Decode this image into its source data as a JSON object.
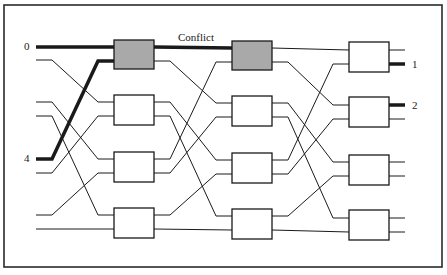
{
  "diagram": {
    "title_label": "Conflict",
    "frame": {
      "x": 4,
      "y": 5,
      "w": 438,
      "h": 262
    },
    "colors": {
      "line": "#1a1a1a",
      "box_fill": "#ffffff",
      "box_conflict_fill": "#a9a9a9",
      "frame": "#2a2a2a"
    },
    "input_x": 36,
    "output_x_end": 405,
    "columns": [
      {
        "x": 114,
        "w": 40,
        "boxes": [
          {
            "y": 40,
            "h": 29,
            "ports": [
              47,
              61
            ],
            "conflict": true
          },
          {
            "y": 95,
            "h": 30,
            "ports": [
              102,
              116
            ],
            "conflict": false
          },
          {
            "y": 152,
            "h": 30,
            "ports": [
              159,
              173
            ],
            "conflict": false
          },
          {
            "y": 208,
            "h": 30,
            "ports": [
              215,
              229
            ],
            "conflict": false
          }
        ]
      },
      {
        "x": 232,
        "w": 40,
        "boxes": [
          {
            "y": 41,
            "h": 29,
            "ports": [
              48,
              62
            ],
            "conflict": true
          },
          {
            "y": 96,
            "h": 30,
            "ports": [
              103,
              117
            ],
            "conflict": false
          },
          {
            "y": 153,
            "h": 30,
            "ports": [
              160,
              174
            ],
            "conflict": false
          },
          {
            "y": 209,
            "h": 30,
            "ports": [
              216,
              230
            ],
            "conflict": false
          }
        ]
      },
      {
        "x": 349,
        "w": 40,
        "boxes": [
          {
            "y": 42,
            "h": 30,
            "ports": [
              50,
              64
            ],
            "conflict": false
          },
          {
            "y": 97,
            "h": 30,
            "ports": [
              105,
              119
            ],
            "conflict": false
          },
          {
            "y": 155,
            "h": 30,
            "ports": [
              162,
              176
            ],
            "conflict": false
          },
          {
            "y": 210,
            "h": 30,
            "ports": [
              218,
              232
            ],
            "conflict": false
          }
        ]
      }
    ],
    "inputs": [
      {
        "y": 47,
        "label": "0",
        "highlight": true
      },
      {
        "y": 60,
        "label": "",
        "highlight": false
      },
      {
        "y": 102,
        "label": "",
        "highlight": false
      },
      {
        "y": 116,
        "label": "",
        "highlight": false
      },
      {
        "y": 159,
        "label": "4",
        "highlight": true
      },
      {
        "y": 173,
        "label": "",
        "highlight": false
      },
      {
        "y": 215,
        "label": "",
        "highlight": false
      },
      {
        "y": 229,
        "label": "",
        "highlight": false
      }
    ],
    "shuffle": [
      0,
      2,
      4,
      6,
      1,
      3,
      5,
      7
    ],
    "highlight_paths": {
      "stage1": [
        [
          0,
          0
        ],
        [
          4,
          1
        ]
      ],
      "stage2_from_col1": [
        [
          0,
          0
        ]
      ]
    },
    "outputs": [
      {
        "label": "",
        "highlight": false
      },
      {
        "label": "1",
        "highlight": true
      },
      {
        "label": "2",
        "highlight": true
      },
      {
        "label": "",
        "highlight": false
      },
      {
        "label": "",
        "highlight": false
      },
      {
        "label": "",
        "highlight": false
      },
      {
        "label": "",
        "highlight": false
      },
      {
        "label": "",
        "highlight": false
      }
    ],
    "labels": {
      "input_0": "0",
      "input_4": "4",
      "output_1": "1",
      "output_2": "2",
      "conflict": "Conflict"
    }
  }
}
